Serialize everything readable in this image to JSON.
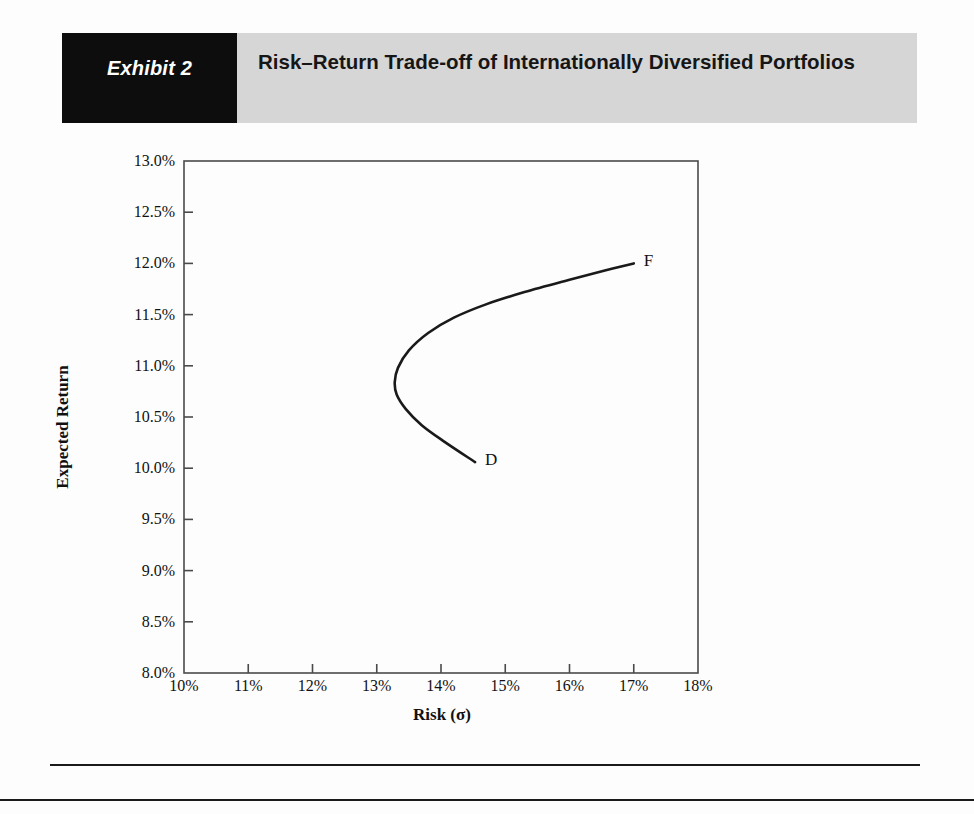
{
  "header": {
    "tag_label": "Exhibit 2",
    "title": "Risk–Return Trade-off of Internationally Diversified Portfolios",
    "tag_bg": "#0d0d0d",
    "bar_bg": "#d6d6d6"
  },
  "chart_data": {
    "type": "line",
    "title": "Risk–Return Trade-off of Internationally Diversified Portfolios",
    "xlabel": "Risk (σ)",
    "ylabel": "Expected Return",
    "xlim": [
      10,
      18
    ],
    "ylim": [
      8.0,
      13.0
    ],
    "grid": false,
    "legend": null,
    "x_tick_labels": [
      "10%",
      "11%",
      "12%",
      "13%",
      "14%",
      "15%",
      "16%",
      "17%",
      "18%"
    ],
    "x_tick_values": [
      10,
      11,
      12,
      13,
      14,
      15,
      16,
      17,
      18
    ],
    "y_tick_labels": [
      "8.0%",
      "8.5%",
      "9.0%",
      "9.5%",
      "10.0%",
      "10.5%",
      "11.0%",
      "11.5%",
      "12.0%",
      "12.5%",
      "13.0%"
    ],
    "y_tick_values": [
      8.0,
      8.5,
      9.0,
      9.5,
      10.0,
      10.5,
      11.0,
      11.5,
      12.0,
      12.5,
      13.0
    ],
    "series": [
      {
        "name": "Efficient frontier D–F",
        "color": "#1a1a1a",
        "points": [
          {
            "x": 14.53,
            "y": 10.06
          },
          {
            "x": 14.05,
            "y": 10.26
          },
          {
            "x": 13.7,
            "y": 10.42
          },
          {
            "x": 13.45,
            "y": 10.58
          },
          {
            "x": 13.31,
            "y": 10.72
          },
          {
            "x": 13.28,
            "y": 10.84
          },
          {
            "x": 13.33,
            "y": 10.98
          },
          {
            "x": 13.5,
            "y": 11.15
          },
          {
            "x": 13.8,
            "y": 11.32
          },
          {
            "x": 14.2,
            "y": 11.47
          },
          {
            "x": 14.7,
            "y": 11.6
          },
          {
            "x": 15.3,
            "y": 11.72
          },
          {
            "x": 16.0,
            "y": 11.84
          },
          {
            "x": 16.55,
            "y": 11.93
          },
          {
            "x": 17.0,
            "y": 12.0
          }
        ]
      }
    ],
    "annotations": [
      {
        "label": "D",
        "x": 14.53,
        "y": 10.06,
        "dx": 10,
        "dy": -1
      },
      {
        "label": "F",
        "x": 17.0,
        "y": 12.0,
        "dx": 10,
        "dy": -1
      }
    ]
  },
  "footer": {
    "rule_color": "#1a1a1a"
  }
}
